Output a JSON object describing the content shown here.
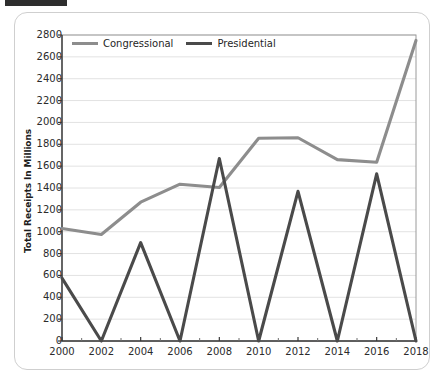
{
  "figure": {
    "y_axis_title": "Total Receipts In Millions",
    "legend_position": "top-left-inside"
  },
  "legend": {
    "entries": [
      {
        "label": "Congressional",
        "color": "#8d8d8d"
      },
      {
        "label": "Presidential",
        "color": "#4a4a4a"
      }
    ]
  },
  "chart_data": {
    "type": "line",
    "title": "",
    "xlabel": "",
    "ylabel": "Total Receipts In Millions",
    "x": [
      2000,
      2002,
      2004,
      2006,
      2008,
      2010,
      2012,
      2014,
      2016,
      2018
    ],
    "xtick_labels": [
      "2000",
      "2002",
      "2004",
      "2006",
      "2008",
      "2010",
      "2012",
      "2014",
      "2016",
      "2018"
    ],
    "ytick_labels": [
      "0",
      "200",
      "400",
      "600",
      "800",
      "1000",
      "1200",
      "1400",
      "1600",
      "1800",
      "2000",
      "2200",
      "2400",
      "2600",
      "2800"
    ],
    "yticks": [
      0,
      200,
      400,
      600,
      800,
      1000,
      1200,
      1400,
      1600,
      1800,
      2000,
      2200,
      2400,
      2600,
      2800
    ],
    "ylim": [
      0,
      2800
    ],
    "xlim": [
      2000,
      2018
    ],
    "grid": "horizontal",
    "series": [
      {
        "name": "Congressional",
        "color": "#8d8d8d",
        "values": [
          1030,
          975,
          1270,
          1435,
          1405,
          1855,
          1860,
          1660,
          1635,
          2750
        ]
      },
      {
        "name": "Presidential",
        "color": "#4a4a4a",
        "values": [
          575,
          0,
          900,
          0,
          1670,
          0,
          1370,
          0,
          1530,
          0
        ]
      }
    ]
  }
}
